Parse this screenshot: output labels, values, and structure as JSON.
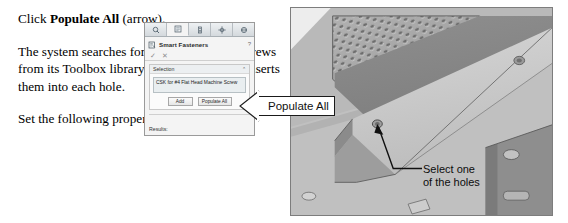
{
  "prose": {
    "p1_pre": "Click ",
    "p1_bold": "Populate All",
    "p1_post": " (arrow).",
    "p2": "The system searches for the best matched screws from its Toolbox library and automatically inserts them into each hole.",
    "p3": "Set the following properties:"
  },
  "property_manager": {
    "title": "Smart Fasteners",
    "help_glyph": "?",
    "ok_glyph": "✓",
    "cancel_glyph": "✕",
    "tabs": [
      {
        "name": "property-manager-tab",
        "icon": "property-manager-icon",
        "active": false
      },
      {
        "name": "feature-manager-tab",
        "icon": "feature-tree-icon",
        "active": true
      },
      {
        "name": "configuration-manager-tab",
        "icon": "configuration-icon",
        "active": false
      },
      {
        "name": "dimxpert-manager-tab",
        "icon": "dimxpert-icon",
        "active": false
      },
      {
        "name": "display-manager-tab",
        "icon": "display-manager-icon",
        "active": false
      }
    ],
    "selection": {
      "header": "Selection",
      "collapse_glyph": "⌃",
      "value": "CSK for #4 Flat Head Machine Screw"
    },
    "buttons": {
      "add": "Add",
      "populate_all": "Populate All"
    },
    "results": {
      "header": "Results:"
    }
  },
  "callout": {
    "label": "Populate All"
  },
  "cad_annotation": {
    "line1": "Select one",
    "line2": "of the holes"
  },
  "colors": {
    "panel_bg": "#f4f4f4",
    "panel_border": "#9a9a9a",
    "tab_bar": "#dfe3e6",
    "listbox_bg": "#e9eef0",
    "callout_border": "#1a1a1a",
    "cad_metal_light": "#c9c9c9",
    "cad_metal_mid": "#a8a8a8",
    "cad_metal_dark": "#8a8a8a",
    "cad_background": "#b9b9b9",
    "text": "#000000"
  }
}
